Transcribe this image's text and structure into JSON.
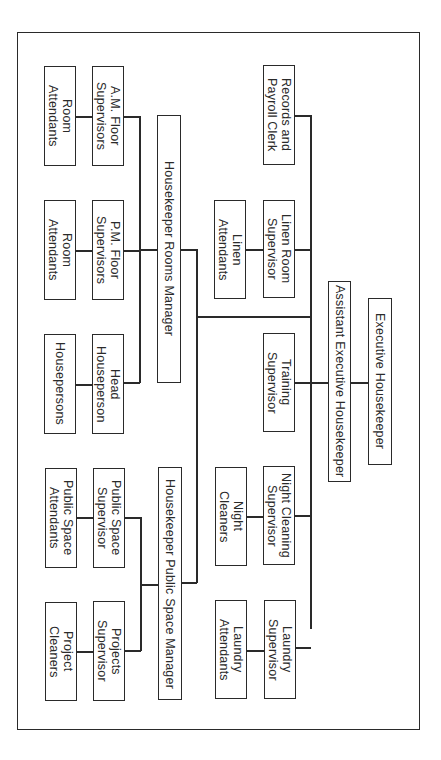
{
  "chart": {
    "orientation": "rotated 90 degrees clockwise",
    "nodes": {
      "executive": "Executive Housekeeper",
      "assistant": "Assistant Executive Housekeeper",
      "records": "Records and\nPayroll Clerk",
      "linen_sup": "Linen Room\nSupervisor",
      "linen_att": "Linen\nAttendants",
      "training": "Training\nSupervisor",
      "night_sup": "Night Cleaning\nSupervisor",
      "night_cln": "Night\nCleaners",
      "laundry_sup": "Laundry\nSupervisor",
      "laundry_att": "Laundry\nAttendants",
      "rooms_mgr": "Housekeeper Rooms Manager",
      "public_mgr": "Housekeeper Public Space Manager",
      "am_sup": "A.M. Floor\nSupervisors",
      "am_att": "Room\nAttendants",
      "pm_sup": "P.M. Floor\nSupervisors",
      "pm_att": "Room\nAttendants",
      "head_hp": "Head\nHouseperson",
      "housepersons": "Housepersons",
      "ps_sup": "Public Space\nSupervisor",
      "ps_att": "Public Space\nAttendants",
      "proj_sup": "Projects\nSupervisor",
      "proj_cln": "Project\nCleaners"
    },
    "hierarchy": [
      {
        "name": "Executive Housekeeper",
        "reports": [
          {
            "name": "Assistant Executive Housekeeper",
            "reports": [
              {
                "name": "Records and Payroll Clerk"
              },
              {
                "name": "Linen Room Supervisor",
                "reports": [
                  {
                    "name": "Linen Attendants"
                  }
                ]
              },
              {
                "name": "Training Supervisor"
              },
              {
                "name": "Night Cleaning Supervisor",
                "reports": [
                  {
                    "name": "Night Cleaners"
                  }
                ]
              },
              {
                "name": "Laundry Supervisor",
                "reports": [
                  {
                    "name": "Laundry Attendants"
                  }
                ]
              },
              {
                "name": "Housekeeper Rooms Manager",
                "reports": [
                  {
                    "name": "A.M. Floor Supervisors",
                    "reports": [
                      {
                        "name": "Room Attendants"
                      }
                    ]
                  },
                  {
                    "name": "P.M. Floor Supervisors",
                    "reports": [
                      {
                        "name": "Room Attendants"
                      }
                    ]
                  },
                  {
                    "name": "Head Houseperson",
                    "reports": [
                      {
                        "name": "Housepersons"
                      }
                    ]
                  }
                ]
              },
              {
                "name": "Housekeeper Public Space Manager",
                "reports": [
                  {
                    "name": "Public Space Supervisor",
                    "reports": [
                      {
                        "name": "Public Space Attendants"
                      }
                    ]
                  },
                  {
                    "name": "Projects Supervisor",
                    "reports": [
                      {
                        "name": "Project Cleaners"
                      }
                    ]
                  }
                ]
              }
            ]
          }
        ]
      }
    ]
  }
}
